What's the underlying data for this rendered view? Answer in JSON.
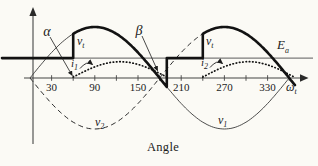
{
  "figure": {
    "ticks": [
      "30",
      "90",
      "150",
      "210",
      "270",
      "330"
    ],
    "labels": {
      "alpha": "α",
      "beta": "β",
      "vt1": {
        "base": "v",
        "sub": "t"
      },
      "vt2": {
        "base": "v",
        "sub": "t"
      },
      "ea": {
        "base": "E",
        "sub": "a"
      },
      "i1": {
        "base": "i",
        "sub": "1"
      },
      "i2": {
        "base": "i",
        "sub": "2"
      },
      "v1": {
        "base": "v",
        "sub": "1"
      },
      "v2": {
        "base": "v",
        "sub": "2"
      },
      "omega_t": {
        "base": "ω",
        "sub": "t"
      }
    },
    "x_title": "Angle"
  },
  "chart_data": {
    "type": "line",
    "title": "",
    "xlabel": "Angle",
    "x_unit": "ωt (degrees)",
    "x_ticks": [
      30,
      90,
      150,
      210,
      270,
      330
    ],
    "x_range": [
      0,
      380
    ],
    "ylim": [
      -1,
      1
    ],
    "grid": false,
    "alpha_deg": 60,
    "beta_deg": 190,
    "ea_over_peak": 0.39,
    "current_peak_over_axis": 0.3,
    "series": [
      {
        "name": "v1",
        "kind": "sine",
        "amplitude": 1,
        "phase_deg": 0,
        "style": "thin-solid",
        "label": "v1"
      },
      {
        "name": "v2",
        "kind": "sine",
        "amplitude": -1,
        "phase_deg": 0,
        "style": "dashed",
        "label": "v2"
      },
      {
        "name": "vt",
        "kind": "piecewise-output",
        "style": "thick-solid",
        "label": "vt",
        "description": "equals Ea while thyristors are off; steps to conducting phase voltage at alpha=60deg each half-cycle and follows it until beta=190deg"
      },
      {
        "name": "i1",
        "kind": "current-pulse",
        "from_deg": 60,
        "to_deg": 190,
        "style": "dotted",
        "label": "i1"
      },
      {
        "name": "i2",
        "kind": "current-pulse",
        "from_deg": 240,
        "to_deg": 367,
        "style": "dotted",
        "label": "i2"
      }
    ],
    "annotations": [
      {
        "text": "α",
        "points_to_deg": 60
      },
      {
        "text": "β",
        "points_to_deg": 190
      },
      {
        "text": "Ea",
        "meaning": "battery emf level"
      }
    ]
  }
}
